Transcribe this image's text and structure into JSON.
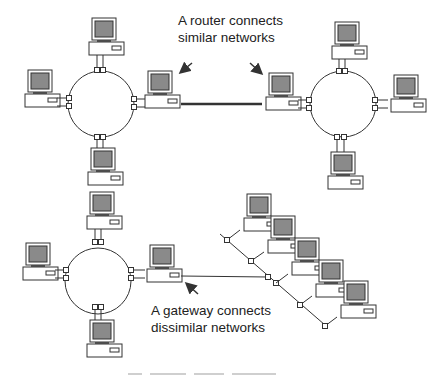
{
  "diagram": {
    "labels": {
      "router": [
        "A router connects",
        "similar networks"
      ],
      "gateway": [
        "A gateway connects",
        "dissimilar networks"
      ]
    },
    "networks": [
      {
        "name": "ring-network-top-left",
        "type": "ring",
        "computers": 4
      },
      {
        "name": "ring-network-top-right",
        "type": "ring",
        "computers": 4
      },
      {
        "name": "ring-network-bottom-left",
        "type": "ring",
        "computers": 4
      },
      {
        "name": "bus-network-bottom-right",
        "type": "tree-bus",
        "computers": 5
      }
    ],
    "links": [
      {
        "name": "router-link",
        "from": "ring-network-top-left",
        "to": "ring-network-top-right",
        "kind": "router"
      },
      {
        "name": "gateway-link",
        "from": "ring-network-bottom-left",
        "to": "bus-network-bottom-right",
        "kind": "gateway"
      }
    ],
    "colors": {
      "line": "#333333",
      "screen": "#8a8a8a",
      "background": "#ffffff"
    }
  }
}
